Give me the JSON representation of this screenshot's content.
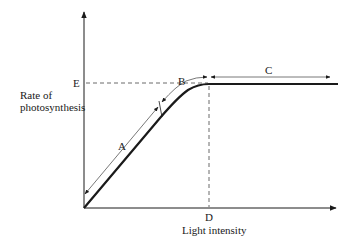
{
  "diagram": {
    "y_axis_label": [
      "Rate of",
      "photosynthesis"
    ],
    "x_axis_label": "Light intensity",
    "point_labels": {
      "E": "E",
      "D": "D"
    },
    "region_labels": {
      "A": "A",
      "B": "B",
      "C": "C"
    },
    "colors": {
      "line": "#1a1a1a",
      "thin_line": "#555555",
      "dashed": "#444444",
      "background": "#ffffff"
    }
  }
}
